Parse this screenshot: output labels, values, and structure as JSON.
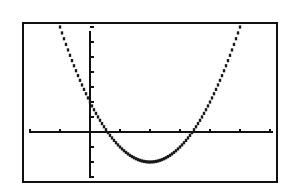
{
  "chart_data": {
    "type": "line",
    "title": "",
    "xlabel": "",
    "ylabel": "",
    "xlim": [
      -2,
      6
    ],
    "ylim": [
      -3.2,
      7
    ],
    "xscale_ticks": 1,
    "yscale_ticks": 1,
    "grid": false,
    "legend": null,
    "series": [
      {
        "name": "y = x^2 - 4x + 2",
        "equation": "y = x^2 - 4x + 2",
        "x": [
          -1.2,
          -1,
          -0.5,
          0,
          0.5,
          0.59,
          1,
          1.5,
          2,
          2.5,
          3,
          3.41,
          3.5,
          4,
          4.5,
          5,
          5.2
        ],
        "y": [
          8.24,
          7,
          4.25,
          2,
          0.25,
          0,
          -1,
          -1.75,
          -2,
          -1.75,
          -1,
          0,
          0.25,
          2,
          4.25,
          7,
          8.24
        ]
      }
    ],
    "annotations": {
      "roots": [
        0.59,
        3.41
      ],
      "vertex": [
        2,
        -2
      ],
      "y_intercept": 2
    }
  },
  "screen": {
    "frame_color": "#111111",
    "curve_color": "#1a1a1a",
    "background": "#ffffff"
  }
}
